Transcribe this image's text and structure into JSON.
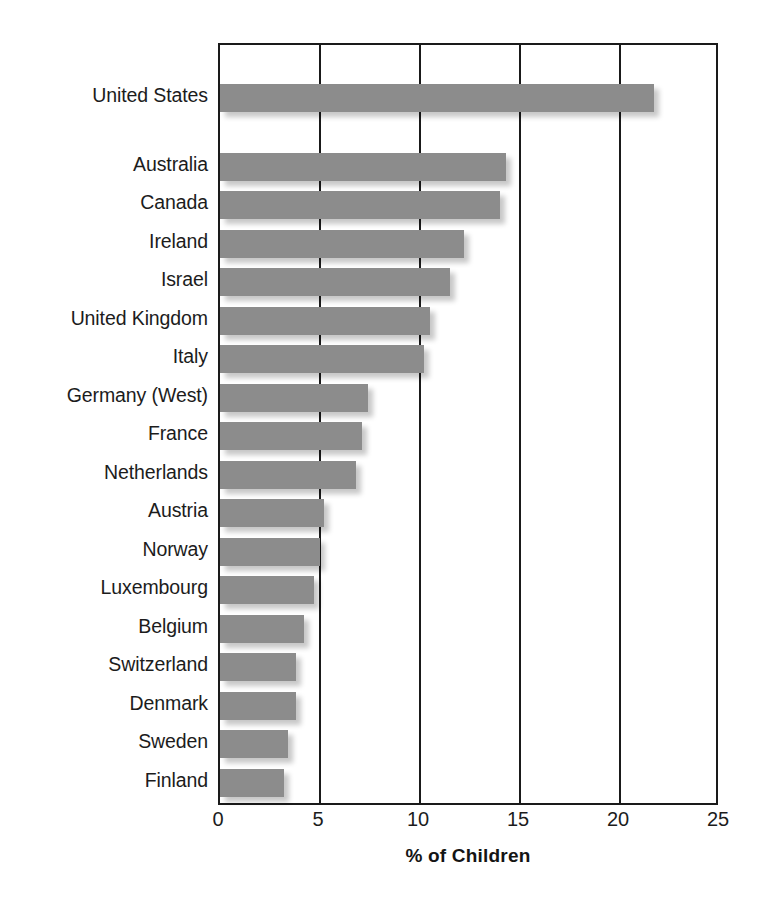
{
  "chart_data": {
    "type": "bar",
    "orientation": "horizontal",
    "title": "",
    "xlabel": "% of Children",
    "ylabel": "",
    "xlim": [
      0,
      25
    ],
    "xticks": [
      0,
      5,
      10,
      15,
      20,
      25
    ],
    "xtick_labels": [
      "0",
      "5",
      "10",
      "15",
      "20",
      "25"
    ],
    "gridlines": [
      5,
      10,
      15,
      20
    ],
    "grid": true,
    "legend": "none",
    "bar_color": "#8c8c8c",
    "axis_color": "#1a1a1a",
    "categories": [
      "United States",
      "Australia",
      "Canada",
      "Ireland",
      "Israel",
      "United Kingdom",
      "Italy",
      "Germany (West)",
      "France",
      "Netherlands",
      "Austria",
      "Norway",
      "Luxembourg",
      "Belgium",
      "Switzerland",
      "Denmark",
      "Sweden",
      "Finland"
    ],
    "values": [
      21.7,
      14.3,
      14.0,
      12.2,
      11.5,
      10.5,
      10.2,
      7.4,
      7.1,
      6.8,
      5.2,
      5.0,
      4.7,
      4.2,
      3.8,
      3.8,
      3.4,
      3.2
    ],
    "group_gap_after_index": 0
  }
}
